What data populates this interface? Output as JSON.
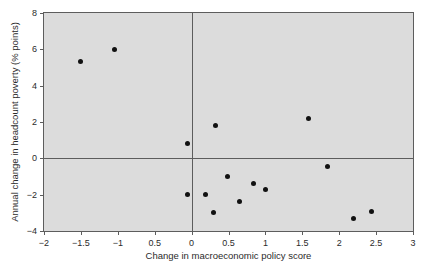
{
  "chart_data": {
    "type": "scatter",
    "title": "",
    "xlabel": "Change in macroeconomic policy score",
    "ylabel": "Annual change in headcount poverty (% points)",
    "xlim": [
      -2,
      3
    ],
    "ylim": [
      -4,
      8
    ],
    "grid": false,
    "legend": null,
    "x_ticks": [
      {
        "value": -2,
        "label": "−2"
      },
      {
        "value": -1.5,
        "label": "−1.5"
      },
      {
        "value": -1,
        "label": "−1"
      },
      {
        "value": -0.5,
        "label": "0.5"
      },
      {
        "value": 0,
        "label": "0"
      },
      {
        "value": 0.5,
        "label": "0.5"
      },
      {
        "value": 1,
        "label": "1"
      },
      {
        "value": 1.5,
        "label": "1.5"
      },
      {
        "value": 2,
        "label": "2"
      },
      {
        "value": 2.5,
        "label": "2.5"
      },
      {
        "value": 3,
        "label": "3"
      }
    ],
    "y_ticks": [
      {
        "value": 8,
        "label": "8"
      },
      {
        "value": 6,
        "label": "6"
      },
      {
        "value": 4,
        "label": "4"
      },
      {
        "value": 2,
        "label": "2"
      },
      {
        "value": 0,
        "label": "0"
      },
      {
        "value": -2,
        "label": "−2"
      },
      {
        "value": -4,
        "label": "−4"
      }
    ],
    "reference_lines": [
      {
        "axis": "y",
        "value": 0
      },
      {
        "axis": "x",
        "value": 0
      }
    ],
    "points": [
      {
        "x": -1.51,
        "y": 5.33
      },
      {
        "x": -1.04,
        "y": 6.0
      },
      {
        "x": -0.05,
        "y": 0.8
      },
      {
        "x": 0.32,
        "y": 1.82
      },
      {
        "x": 1.59,
        "y": 2.2
      },
      {
        "x": 1.84,
        "y": -0.45
      },
      {
        "x": -0.05,
        "y": -2.0
      },
      {
        "x": 0.19,
        "y": -2.0
      },
      {
        "x": 0.3,
        "y": -3.0
      },
      {
        "x": 0.48,
        "y": -1.02
      },
      {
        "x": 0.65,
        "y": -2.4
      },
      {
        "x": 0.84,
        "y": -1.38
      },
      {
        "x": 1.0,
        "y": -1.72
      },
      {
        "x": 2.2,
        "y": -3.32
      },
      {
        "x": 2.44,
        "y": -2.9
      }
    ],
    "colors": {
      "plot_background": "#dcdcdc",
      "frame": "#5d5d5d",
      "marker": "#111111",
      "text": "#2b2b2b"
    }
  }
}
